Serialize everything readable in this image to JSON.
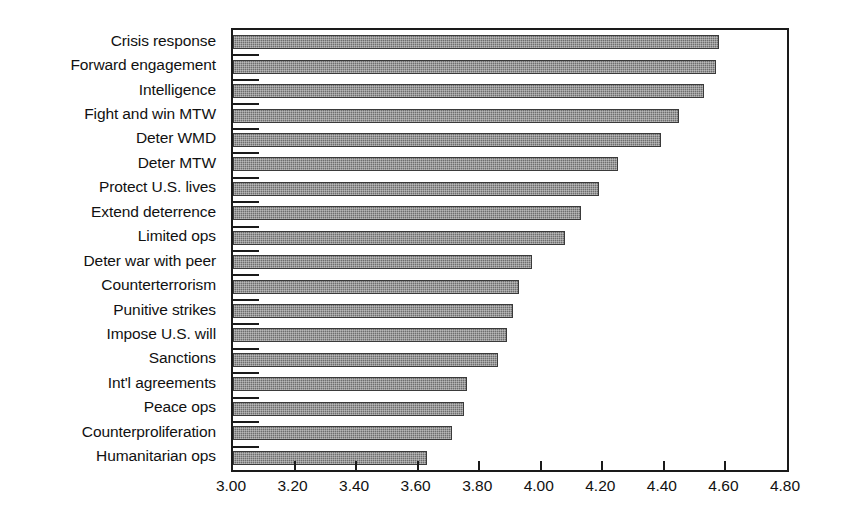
{
  "chart_data": {
    "type": "bar",
    "orientation": "horizontal",
    "title": "",
    "subtitle": "",
    "xlabel": "",
    "ylabel": "",
    "xlim": [
      3.0,
      4.8
    ],
    "ylim": null,
    "grid": false,
    "legend": null,
    "legend_position": "none",
    "xticks": [
      "3.00",
      "3.20",
      "3.40",
      "3.60",
      "3.80",
      "4.00",
      "4.20",
      "4.40",
      "4.60",
      "4.80"
    ],
    "xtick_values": [
      3.0,
      3.2,
      3.4,
      3.6,
      3.8,
      4.0,
      4.2,
      4.4,
      4.6,
      4.8
    ],
    "categories": [
      "Crisis response",
      "Forward engagement",
      "Intelligence",
      "Fight and win MTW",
      "Deter WMD",
      "Deter MTW",
      "Protect U.S. lives",
      "Extend deterrence",
      "Limited ops",
      "Deter war with peer",
      "Counterterrorism",
      "Punitive strikes",
      "Impose U.S. will",
      "Sanctions",
      "Int'l agreements",
      "Peace ops",
      "Counterproliferation",
      "Humanitarian ops"
    ],
    "values": [
      4.58,
      4.57,
      4.53,
      4.45,
      4.39,
      4.25,
      4.19,
      4.13,
      4.08,
      3.97,
      3.93,
      3.91,
      3.89,
      3.86,
      3.76,
      3.75,
      3.71,
      3.63
    ],
    "bar_color": "#6e6e6e",
    "bar_edge_color": "#3a3a3a",
    "axis_color": "#1a1a1a",
    "background_color": "#ffffff"
  }
}
